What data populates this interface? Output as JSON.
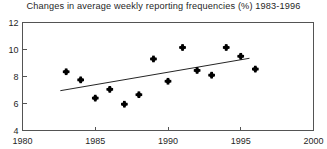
{
  "chart_data": {
    "type": "scatter",
    "title": "Changes in average weekly reporting frequencies (%) 1983-1996",
    "xlabel": "",
    "ylabel": "",
    "grid": false,
    "legend": false,
    "legend_position": "none",
    "xlim": [
      1980,
      2000
    ],
    "ylim": [
      4,
      12
    ],
    "xticks": [
      1980,
      1985,
      1990,
      1995,
      2000
    ],
    "xtick_labels": [
      "1980",
      "1985",
      "1990",
      "1995",
      "2000"
    ],
    "yticks": [
      4,
      6,
      8,
      10,
      12
    ],
    "ytick_labels": [
      "4",
      "6",
      "8",
      "10",
      "12"
    ],
    "marker_style": "filled-diamond-plus",
    "marker_color": "#000000",
    "x": [
      1983,
      1984,
      1985,
      1986,
      1987,
      1988,
      1989,
      1990,
      1991,
      1992,
      1993,
      1994,
      1995,
      1996
    ],
    "values": [
      8.35,
      7.75,
      6.4,
      7.05,
      5.95,
      6.65,
      9.3,
      7.65,
      10.15,
      8.45,
      8.1,
      10.15,
      9.5,
      8.55
    ],
    "series": [
      {
        "name": "Average weekly reporting frequency (%)",
        "x": [
          1983,
          1984,
          1985,
          1986,
          1987,
          1988,
          1989,
          1990,
          1991,
          1992,
          1993,
          1994,
          1995,
          1996
        ],
        "values": [
          8.35,
          7.75,
          6.4,
          7.05,
          5.95,
          6.65,
          9.3,
          7.65,
          10.15,
          8.45,
          8.1,
          10.15,
          9.5,
          8.55
        ]
      }
    ],
    "trendline": {
      "type": "linear-fit",
      "x_start": 1982.6,
      "y_start": 6.95,
      "x_end": 1995.6,
      "y_end": 9.35,
      "color": "#252525"
    }
  },
  "colors": {
    "background": "#ffffff",
    "axis": "#545454",
    "text": "#1f1f1f",
    "marker": "#000000",
    "trend": "#252525"
  }
}
